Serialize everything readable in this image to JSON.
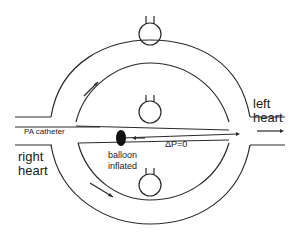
{
  "diagram": {
    "type": "pulmonary-circulation-schematic",
    "labels": {
      "pa_catheter": "PA catheter",
      "right_heart_line1": "right",
      "right_heart_line2": "heart",
      "left_heart_line1": "left",
      "left_heart_line2": "heart",
      "balloon_line1": "balloon",
      "balloon_line2": "inflated",
      "delta_p": "ΔP=0"
    },
    "zones": [
      "upper-alveolus",
      "middle-alveolus",
      "lower-alveolus"
    ],
    "colors": {
      "stroke": "#2a2a2a",
      "balloon": "#111111",
      "background": "#ffffff"
    }
  }
}
